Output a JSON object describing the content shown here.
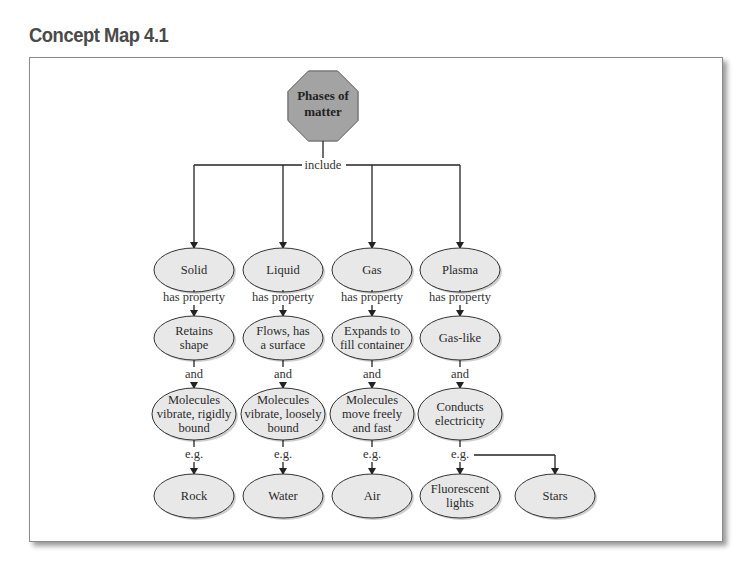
{
  "title": "Concept Map 4.1",
  "root": {
    "lines": [
      "Phases of",
      "matter"
    ]
  },
  "root_link": "include",
  "colors": {
    "node_fill": "#e8e8e8",
    "root_fill": "#a3a3a3",
    "stroke": "#333333",
    "title": "#4a4a4a"
  },
  "columns": [
    {
      "phase": "Solid",
      "link1": "has property",
      "property": [
        "Retains",
        "shape"
      ],
      "link2": "and",
      "behavior": [
        "Molecules",
        "vibrate, rigidly",
        "bound"
      ],
      "link3": "e.g.",
      "examples": [
        [
          "Rock"
        ]
      ]
    },
    {
      "phase": "Liquid",
      "link1": "has property",
      "property": [
        "Flows, has",
        "a surface"
      ],
      "link2": "and",
      "behavior": [
        "Molecules",
        "vibrate, loosely",
        "bound"
      ],
      "link3": "e.g.",
      "examples": [
        [
          "Water"
        ]
      ]
    },
    {
      "phase": "Gas",
      "link1": "has property",
      "property": [
        "Expands to",
        "fill container"
      ],
      "link2": "and",
      "behavior": [
        "Molecules",
        "move freely",
        "and fast"
      ],
      "link3": "e.g.",
      "examples": [
        [
          "Air"
        ]
      ]
    },
    {
      "phase": "Plasma",
      "link1": "has property",
      "property": [
        "Gas-like"
      ],
      "link2": "and",
      "behavior": [
        "Conducts",
        "electricity"
      ],
      "link3": "e.g.",
      "examples": [
        [
          "Fluorescent",
          "lights"
        ],
        [
          "Stars"
        ]
      ]
    }
  ]
}
